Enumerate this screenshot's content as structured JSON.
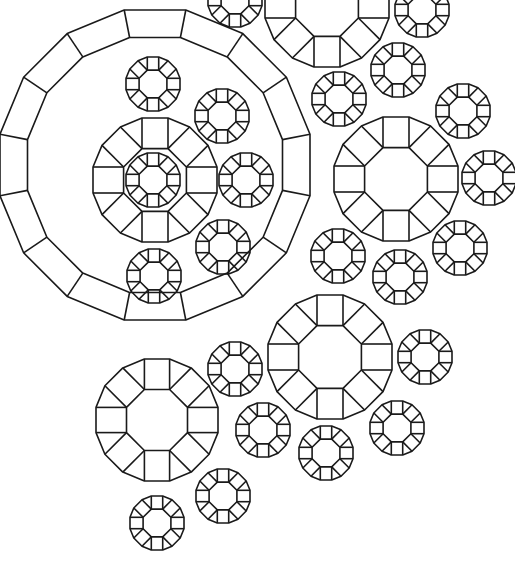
{
  "artwork": {
    "title": "",
    "description": "Line-art pattern of octagonal gem-like rings",
    "background": "#ffffff",
    "stroke_color": "#1a1a1a",
    "large_rings": [
      {
        "cx": 155,
        "cy": 165,
        "r_out": 158,
        "r_in": 130,
        "sides": 16
      }
    ],
    "medium_rings": [
      {
        "cx": 155,
        "cy": 180,
        "r_out": 62,
        "r_in": 34
      },
      {
        "cx": 327,
        "cy": 5,
        "r_out": 62,
        "r_in": 34
      },
      {
        "cx": 396,
        "cy": 179,
        "r_out": 62,
        "r_in": 34
      },
      {
        "cx": 330,
        "cy": 357,
        "r_out": 62,
        "r_in": 34
      },
      {
        "cx": 157,
        "cy": 420,
        "r_out": 61,
        "r_in": 33
      }
    ],
    "small_rings": [
      {
        "cx": 153,
        "cy": 180,
        "r_out": 27,
        "r_in": 15
      },
      {
        "cx": 153,
        "cy": 84,
        "r_out": 27,
        "r_in": 15
      },
      {
        "cx": 222,
        "cy": 116,
        "r_out": 27,
        "r_in": 15
      },
      {
        "cx": 246,
        "cy": 180,
        "r_out": 27,
        "r_in": 15
      },
      {
        "cx": 223,
        "cy": 247,
        "r_out": 27,
        "r_in": 15
      },
      {
        "cx": 154,
        "cy": 276,
        "r_out": 27,
        "r_in": 15
      },
      {
        "cx": 235,
        "cy": 0,
        "r_out": 27,
        "r_in": 15
      },
      {
        "cx": 422,
        "cy": 10,
        "r_out": 27,
        "r_in": 15
      },
      {
        "cx": 398,
        "cy": 70,
        "r_out": 27,
        "r_in": 15
      },
      {
        "cx": 339,
        "cy": 99,
        "r_out": 27,
        "r_in": 15
      },
      {
        "cx": 463,
        "cy": 111,
        "r_out": 27,
        "r_in": 15
      },
      {
        "cx": 489,
        "cy": 178,
        "r_out": 27,
        "r_in": 15
      },
      {
        "cx": 460,
        "cy": 248,
        "r_out": 27,
        "r_in": 15
      },
      {
        "cx": 400,
        "cy": 277,
        "r_out": 27,
        "r_in": 15
      },
      {
        "cx": 338,
        "cy": 256,
        "r_out": 27,
        "r_in": 15
      },
      {
        "cx": 235,
        "cy": 369,
        "r_out": 27,
        "r_in": 15
      },
      {
        "cx": 425,
        "cy": 357,
        "r_out": 27,
        "r_in": 15
      },
      {
        "cx": 263,
        "cy": 430,
        "r_out": 27,
        "r_in": 15
      },
      {
        "cx": 326,
        "cy": 453,
        "r_out": 27,
        "r_in": 15
      },
      {
        "cx": 397,
        "cy": 428,
        "r_out": 27,
        "r_in": 15
      },
      {
        "cx": 223,
        "cy": 496,
        "r_out": 27,
        "r_in": 15
      },
      {
        "cx": 157,
        "cy": 523,
        "r_out": 27,
        "r_in": 15
      }
    ]
  }
}
